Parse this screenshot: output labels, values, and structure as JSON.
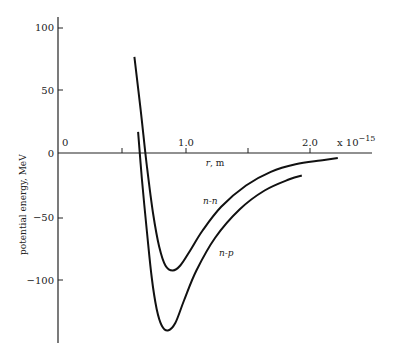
{
  "chart_data": {
    "type": "line",
    "title": "",
    "xlabel": "r, m",
    "xlabel_multiplier": "x 10",
    "xlabel_exponent": "−15",
    "ylabel": "potential energy, MeV",
    "xlim": [
      0,
      2.4
    ],
    "ylim": [
      -150,
      110
    ],
    "x_ticks": [
      0,
      0.5,
      1.0,
      1.5,
      2.0
    ],
    "x_tick_labels": [
      {
        "value": 0,
        "label": "0"
      },
      {
        "value": 1.0,
        "label": "1.0"
      },
      {
        "value": 2.0,
        "label": "2.0"
      }
    ],
    "y_ticks": [
      100,
      50,
      0,
      -50,
      -100
    ],
    "y_tick_labels": [
      "100",
      "50",
      "0",
      "−50",
      "−100"
    ],
    "grid": false,
    "legend": "inline labels",
    "series": [
      {
        "name": "n-n",
        "x": [
          0.6,
          0.65,
          0.7,
          0.75,
          0.8,
          0.85,
          0.91,
          0.97,
          1.05,
          1.15,
          1.3,
          1.5,
          1.7,
          1.9,
          2.1,
          2.24
        ],
        "y": [
          77,
          35,
          -10,
          -48,
          -75,
          -90,
          -94,
          -90,
          -78,
          -62,
          -43,
          -26,
          -15,
          -9,
          -6,
          -4
        ]
      },
      {
        "name": "n-p",
        "x": [
          0.63,
          0.66,
          0.7,
          0.74,
          0.78,
          0.82,
          0.87,
          0.93,
          1.0,
          1.1,
          1.25,
          1.45,
          1.65,
          1.85,
          1.95
        ],
        "y": [
          17,
          -20,
          -62,
          -100,
          -125,
          -138,
          -142,
          -136,
          -118,
          -94,
          -68,
          -45,
          -30,
          -21,
          -18
        ]
      }
    ]
  },
  "labels": {
    "y100": "100",
    "y50": "50",
    "y0": "0",
    "ym50": "−50",
    "ym100": "−100",
    "x0": "0",
    "x1": "1.0",
    "x2": "2.0",
    "xunit": "r, m",
    "xmult": "x 10",
    "xexp": "−15",
    "ytitle": "potential energy, MeV",
    "nn": "n-n",
    "np": "n-p"
  }
}
